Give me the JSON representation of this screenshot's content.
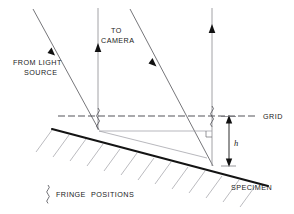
{
  "diagram": {
    "labels": {
      "from_light_source_line1": "FROM LIGHT",
      "from_light_source_line2": "SOURCE",
      "to_camera_line1": "TO",
      "to_camera_line2": "CAMERA",
      "grid": "GRID",
      "specimen": "SPECIMEN",
      "height_symbol": "h",
      "legend_text_line1": "FRINGE",
      "legend_text_line2": "POSITIONS"
    },
    "icons": {
      "light_ray_arrow": "arrow-down-icon",
      "camera_ray_arrow": "arrow-up-icon",
      "dimension_arrow": "double-arrow-vertical-icon",
      "fringe_marker": "squiggle-icon"
    },
    "colors": {
      "specimen": "#141414",
      "grid": "#4a4a50",
      "ray": "#5d5d62",
      "hatching": "#a9a9af",
      "text": "#1a1a1a",
      "background": "#ffffff"
    },
    "geometry": {
      "grid_line_y": 116,
      "grid_line_x_start": 58,
      "grid_line_x_end": 256,
      "specimen_start_x": 52,
      "specimen_start_y": 129,
      "specimen_end_x": 268,
      "specimen_end_y": 186,
      "fringe_left_x": 98,
      "fringe_right_x": 212,
      "height_top_y": 117,
      "height_bottom_y": 165
    }
  }
}
